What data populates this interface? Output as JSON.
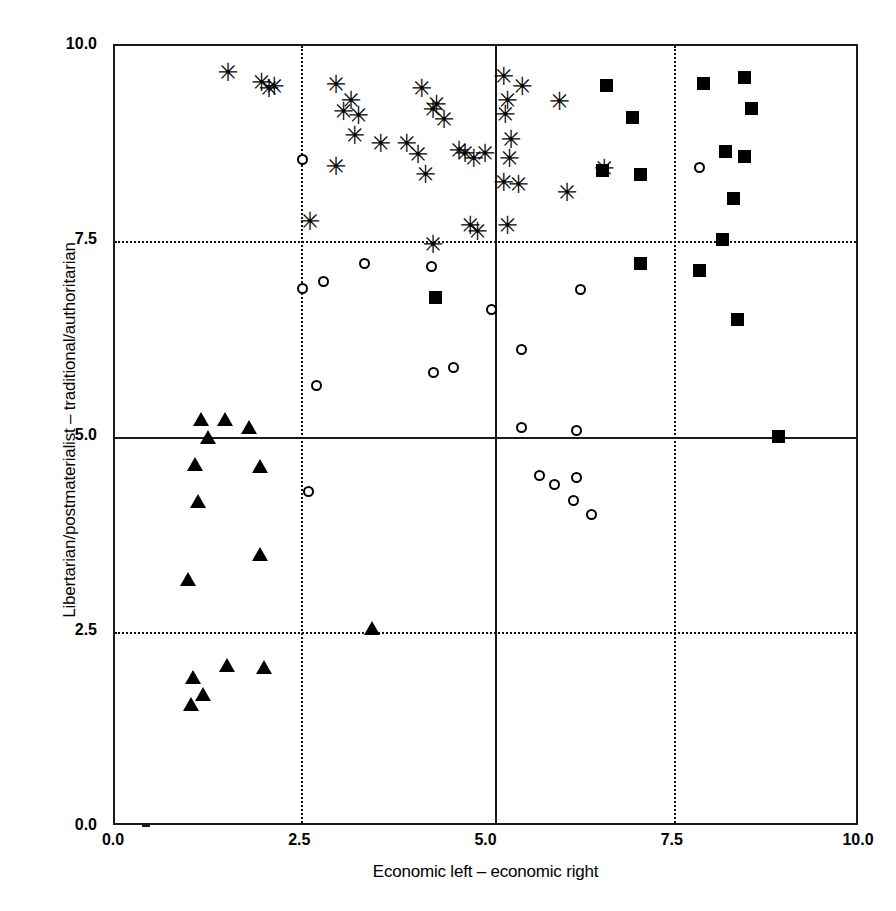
{
  "chart_data": {
    "type": "scatter",
    "title": "",
    "xlabel": "Economic left – economic right",
    "ylabel": "Libertarian/postmaterialist – traditional/authoritarian",
    "xlim": [
      0.0,
      10.0
    ],
    "ylim": [
      0.0,
      10.0
    ],
    "xticks": [
      "0.0",
      "2.5",
      "5.0",
      "7.5",
      "10.0"
    ],
    "ytick_values": [
      0.0,
      2.5,
      5.0,
      7.5,
      10.0
    ],
    "xtick_values": [
      0.0,
      2.5,
      5.0,
      7.5,
      10.0
    ],
    "yticks": [
      "0.0",
      "2.5",
      "5.0",
      "7.5",
      "10.0"
    ],
    "grid": "dotted gridlines at 2.5 and 7.5 on both axes",
    "reference_lines": {
      "vertical_x": 5.1,
      "horizontal_y": 5.0,
      "style": "solid"
    },
    "legend_position": "top-right (clipped)",
    "series": [
      {
        "name": "asterisk-series",
        "marker": "asterisk",
        "points": [
          [
            1.5,
            9.65
          ],
          [
            1.95,
            9.52
          ],
          [
            2.05,
            9.45
          ],
          [
            2.12,
            9.47
          ],
          [
            2.95,
            9.5
          ],
          [
            3.15,
            9.3
          ],
          [
            3.05,
            9.15
          ],
          [
            3.25,
            9.1
          ],
          [
            3.2,
            8.85
          ],
          [
            3.55,
            8.75
          ],
          [
            2.6,
            7.75
          ],
          [
            2.95,
            8.45
          ],
          [
            4.1,
            9.45
          ],
          [
            4.3,
            9.25
          ],
          [
            4.25,
            9.18
          ],
          [
            4.4,
            9.05
          ],
          [
            4.05,
            8.6
          ],
          [
            4.15,
            8.35
          ],
          [
            3.9,
            8.75
          ],
          [
            4.25,
            7.45
          ],
          [
            4.6,
            8.65
          ],
          [
            4.68,
            8.62
          ],
          [
            4.8,
            8.55
          ],
          [
            4.75,
            7.7
          ],
          [
            4.85,
            7.62
          ],
          [
            5.2,
            9.6
          ],
          [
            5.25,
            9.3
          ],
          [
            5.22,
            9.12
          ],
          [
            5.3,
            8.8
          ],
          [
            5.28,
            8.55
          ],
          [
            5.45,
            9.48
          ],
          [
            5.2,
            8.25
          ],
          [
            5.4,
            8.22
          ],
          [
            5.25,
            7.7
          ],
          [
            5.95,
            9.28
          ],
          [
            6.05,
            8.12
          ],
          [
            6.55,
            8.42
          ],
          [
            4.95,
            8.62
          ]
        ]
      },
      {
        "name": "square-series",
        "marker": "filled-square",
        "points": [
          [
            6.6,
            9.5
          ],
          [
            6.95,
            9.08
          ],
          [
            7.05,
            8.35
          ],
          [
            6.55,
            8.4
          ],
          [
            7.05,
            7.22
          ],
          [
            7.9,
            9.52
          ],
          [
            8.45,
            9.6
          ],
          [
            8.55,
            9.2
          ],
          [
            8.2,
            8.65
          ],
          [
            8.45,
            8.58
          ],
          [
            8.3,
            8.05
          ],
          [
            8.15,
            7.52
          ],
          [
            7.85,
            7.12
          ],
          [
            8.35,
            6.5
          ],
          [
            8.9,
            5.0
          ],
          [
            4.3,
            6.78
          ]
        ]
      },
      {
        "name": "circle-series",
        "marker": "open-circle",
        "points": [
          [
            2.52,
            8.55
          ],
          [
            2.52,
            6.9
          ],
          [
            2.8,
            6.98
          ],
          [
            3.35,
            7.22
          ],
          [
            2.7,
            5.65
          ],
          [
            4.25,
            7.18
          ],
          [
            4.28,
            5.82
          ],
          [
            4.55,
            5.88
          ],
          [
            5.05,
            6.62
          ],
          [
            5.45,
            6.12
          ],
          [
            6.25,
            6.88
          ],
          [
            5.45,
            5.12
          ],
          [
            6.2,
            5.08
          ],
          [
            7.85,
            8.45
          ],
          [
            2.6,
            4.3
          ],
          [
            5.7,
            4.5
          ],
          [
            5.9,
            4.38
          ],
          [
            6.2,
            4.48
          ],
          [
            6.15,
            4.18
          ],
          [
            6.4,
            4.0
          ]
        ]
      },
      {
        "name": "triangle-series",
        "marker": "filled-triangle",
        "points": [
          [
            1.15,
            5.22
          ],
          [
            1.48,
            5.22
          ],
          [
            1.8,
            5.12
          ],
          [
            1.25,
            5.0
          ],
          [
            1.08,
            4.65
          ],
          [
            1.95,
            4.62
          ],
          [
            1.12,
            4.18
          ],
          [
            1.95,
            3.5
          ],
          [
            0.98,
            3.18
          ],
          [
            3.45,
            2.55
          ],
          [
            1.5,
            2.08
          ],
          [
            2.0,
            2.05
          ],
          [
            1.05,
            1.92
          ],
          [
            1.18,
            1.7
          ],
          [
            1.02,
            1.58
          ]
        ]
      }
    ]
  },
  "legend": {
    "items": [
      "",
      ""
    ]
  }
}
